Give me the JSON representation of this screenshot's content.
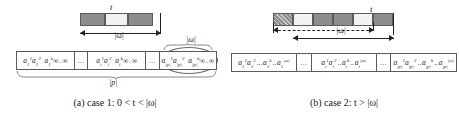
{
  "figure": {
    "panels": [
      {
        "id": "a",
        "caption_prefix": "(a) case 1: ",
        "caption_math": "0 < t < |ω|",
        "caption_full": "(a) case 1: 0 < t < |ω|",
        "strip": {
          "label_t": "t",
          "label_omega": "|ω|",
          "blocks": [
            {
              "shade": "dark"
            },
            {
              "shade": "light"
            },
            {
              "shade": "dark"
            }
          ]
        },
        "table": {
          "brace_top_label": "|ω|",
          "brace_bottom_label": "|p|",
          "groups": [
            {
              "type": "cells",
              "items": [
                {
                  "base": "a",
                  "sup": "1",
                  "sub": "1"
                },
                {
                  "base": "a",
                  "sup": "2",
                  "sub": "1"
                },
                {
                  "sep": "..."
                },
                {
                  "base": "a",
                  "sup": "k",
                  "sub": "1"
                },
                {
                  "base": "∞"
                },
                {
                  "sep": ".."
                },
                {
                  "base": "∞"
                }
              ]
            },
            {
              "type": "ellipsis",
              "text": "..."
            },
            {
              "type": "cells",
              "items": [
                {
                  "base": "a",
                  "sup": "1",
                  "sub": "i"
                },
                {
                  "base": "a",
                  "sup": "2",
                  "sub": "i"
                },
                {
                  "sep": "..."
                },
                {
                  "base": "a",
                  "sup": "k",
                  "sub": "i"
                },
                {
                  "base": "∞"
                },
                {
                  "sep": ".."
                },
                {
                  "base": "∞"
                }
              ]
            },
            {
              "type": "ellipsis",
              "text": "..."
            },
            {
              "type": "cells",
              "highlight": true,
              "items": [
                {
                  "base": "a",
                  "sup": "1",
                  "sub": "|p|"
                },
                {
                  "base": "a",
                  "sup": "2",
                  "sub": "|p|"
                },
                {
                  "sep": "..."
                },
                {
                  "base": "a",
                  "sup": "k",
                  "sub": "|p|"
                },
                {
                  "base": "∞"
                },
                {
                  "sep": ".."
                },
                {
                  "base": "∞"
                }
              ]
            }
          ]
        }
      },
      {
        "id": "b",
        "caption_prefix": "(b) case 2: ",
        "caption_math": "t > |ω|",
        "caption_full": "(b) case 2: t > |ω|",
        "strip": {
          "label_t": "t",
          "label_omega": "|ω|",
          "blocks": [
            {
              "shade": "hatch"
            },
            {
              "shade": "light"
            },
            {
              "shade": "dark"
            },
            {
              "shade": "dark"
            },
            {
              "shade": "light"
            },
            {
              "shade": "dark"
            }
          ]
        },
        "table": {
          "groups": [
            {
              "type": "cells",
              "items": [
                {
                  "base": "a",
                  "sup": "1",
                  "sub": "1"
                },
                {
                  "base": "a",
                  "sup": "2",
                  "sub": "1"
                },
                {
                  "sep": "..."
                },
                {
                  "base": "a",
                  "sup": "k",
                  "sub": "1"
                },
                {
                  "sep": ".."
                },
                {
                  "base": "a",
                  "sup": "|ω|",
                  "sub": "1"
                }
              ]
            },
            {
              "type": "ellipsis",
              "text": "..."
            },
            {
              "type": "cells",
              "items": [
                {
                  "base": "a",
                  "sup": "1",
                  "sub": "i"
                },
                {
                  "base": "a",
                  "sup": "2",
                  "sub": "i"
                },
                {
                  "sep": ".."
                },
                {
                  "base": "a",
                  "sup": "k",
                  "sub": "i"
                },
                {
                  "sep": ".."
                },
                {
                  "base": "a",
                  "sup": "|ω|",
                  "sub": "i"
                }
              ]
            },
            {
              "type": "ellipsis",
              "text": "..."
            },
            {
              "type": "cells",
              "items": [
                {
                  "base": "a",
                  "sup": "1",
                  "sub": "|p|"
                },
                {
                  "base": "a",
                  "sup": "2",
                  "sub": "|p|"
                },
                {
                  "sep": ".."
                },
                {
                  "base": "a",
                  "sup": "k",
                  "sub": "|p|"
                },
                {
                  "sep": ".."
                },
                {
                  "base": "a",
                  "sup": "|ω|",
                  "sub": "|p|"
                }
              ]
            }
          ]
        }
      }
    ],
    "colors": {
      "block_dark": "#8d8d8d",
      "block_light": "#f2f2f2",
      "line": "#5a5a5a",
      "text": "#1a1a1a"
    }
  }
}
